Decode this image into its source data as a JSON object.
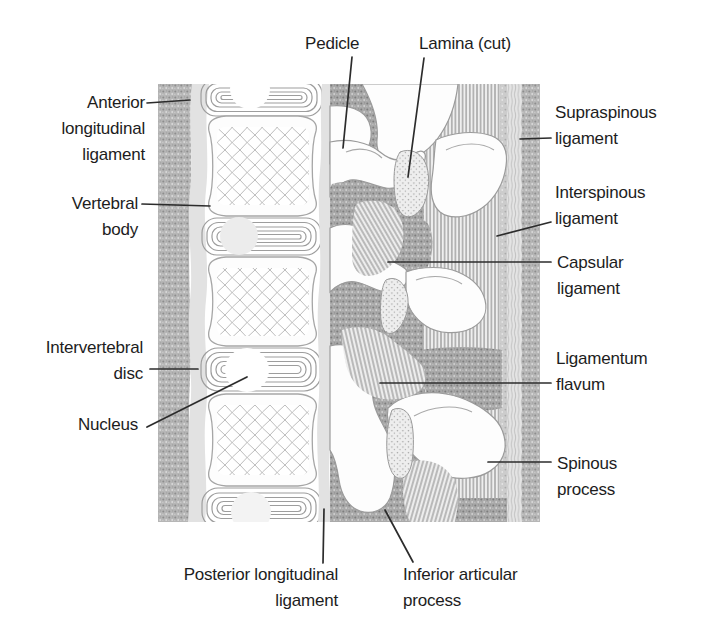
{
  "diagram": {
    "type": "anatomical-illustration",
    "colors": {
      "background": "#ffffff",
      "label_text": "#1d1d1d",
      "leader_line": "#2c2c2c",
      "stipple_tissue": "#b6b6b6",
      "ligament_band_light": "#e2e2e2",
      "bone_white": "#fdfdfd"
    },
    "labels": {
      "pedicle": "Pedicle",
      "lamina_cut": "Lamina (cut)",
      "anterior_longitudinal_ligament": "Anterior\nlongitudinal\nligament",
      "vertebral_body": "Vertebral\nbody",
      "intervertebral_disc": "Intervertebral\ndisc",
      "nucleus": "Nucleus",
      "supraspinous_ligament": "Supraspinous\nligament",
      "interspinous_ligament": "Interspinous\nligament",
      "capsular_ligament": "Capsular\nligament",
      "ligamentum_flavum": "Ligamentum\nflavum",
      "spinous_process": "Spinous\nprocess",
      "posterior_longitudinal_ligament": "Posterior longitudinal\nligament",
      "inferior_articular_process": "Inferior articular\nprocess"
    }
  }
}
